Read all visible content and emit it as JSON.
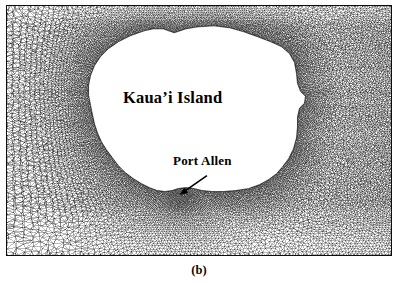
{
  "figure": {
    "caption": "(b)",
    "type": "unstructured-triangular-finite-element-mesh"
  },
  "panel": {
    "border_color": "#0d0d0d",
    "background_color": "#ffffff",
    "mesh_color": "#111111",
    "left": 6,
    "top": 5,
    "width": 386,
    "height": 251
  },
  "labels": {
    "island": "Kaua’i Island",
    "port": "Port Allen"
  },
  "annotations": {
    "arrow": {
      "name": "port-allen-arrow",
      "from_x": 201,
      "from_y": 171,
      "to_x": 174,
      "to_y": 190
    }
  },
  "island": {
    "name": "Kaua'i Island",
    "fill_color": "#ffffff",
    "outline_color": "#111111",
    "outline_points": "157,23 168,27 180,23 192,21 208,20 224,22 238,26 252,31 265,36 276,41 284,48 289,57 291,68 292,78 295,86 300,91 299,98 294,103 292,112 292,122 291,133 288,144 283,154 277,162 271,169 263,175 254,180 243,184 230,186 218,187 206,187 196,186 188,184 180,183 172,184 166,186 159,187 151,186 143,183 135,179 127,174 119,168 112,161 106,153 100,145 95,137 91,128 88,119 86,110 84,100 82,90 82,80 84,70 88,60 94,51 102,43 112,36 124,30 138,25 147,23"
  },
  "mesh": {
    "refinement_focus": {
      "name": "port-allen",
      "x": 174,
      "y": 190,
      "label": "Port Allen"
    },
    "coarse_region": "upper-left and lower-left ocean corners",
    "fine_region": "coastline of Kaua'i Island and Port Allen harbor",
    "element_type": "triangle",
    "approximate_element_count": 18000
  },
  "chart_data": {
    "type": "diagram",
    "title": "(b)",
    "subtitle": "",
    "xlabel": "",
    "ylabel": "",
    "grid": false,
    "legend": "none",
    "annotations": [
      "Kaua’i Island",
      "Port Allen"
    ]
  }
}
